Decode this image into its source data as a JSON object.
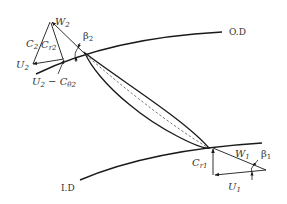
{
  "diagram": {
    "type": "velocity-triangle",
    "colors": {
      "stroke": "#1a1a1a",
      "text": "#333333",
      "dashed": "#555555"
    },
    "labels": {
      "outer_diameter": "O.D",
      "inner_diameter": "I.D",
      "w2": "W",
      "w2_sub": "2",
      "c2": "C",
      "c2_sub": "2",
      "cr2": "C",
      "cr2_sub": "r2",
      "u2": "U",
      "u2_sub": "2",
      "u2_minus": "U",
      "u2_minus_sub": "2",
      "u2_minus_op": " − C",
      "u2_minus_sub2": "θ2",
      "beta2": "β",
      "beta2_sub": "2",
      "w1": "W",
      "w1_sub": "1",
      "beta1": "β",
      "beta1_sub": "1",
      "cr1": "C",
      "cr1_sub": "r1",
      "u1": "U",
      "u1_sub": "1"
    }
  }
}
